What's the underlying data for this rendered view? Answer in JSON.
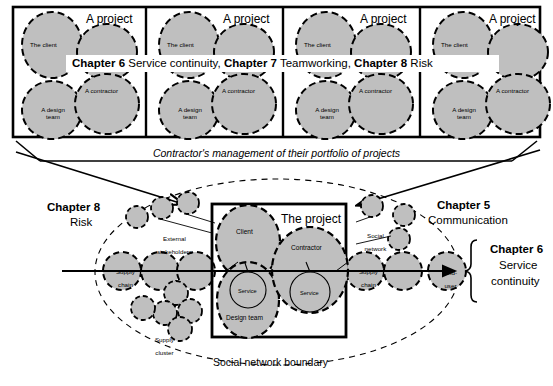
{
  "diagram": {
    "title_banner": {
      "segments": [
        {
          "bold": "Chapter 6",
          "text": " Service continuity,"
        },
        {
          "bold": "Chapter 7",
          "text": " Teamworking,"
        },
        {
          "bold": "Chapter 8",
          "text": " Risk"
        }
      ],
      "full_text": "Chapter 6 Service continuity, Chapter 7 Teamworking, Chapter 8 Risk"
    },
    "portfolio_caption": "Contractor's management of their portfolio of projects",
    "portfolio": {
      "panel_count": 4,
      "panels": [
        {
          "title": "A project",
          "nodes": [
            "The client",
            "A contractor",
            "A design team"
          ]
        },
        {
          "title": "A project",
          "nodes": [
            "The client",
            "A contractor",
            "A design team"
          ]
        },
        {
          "title": "A project",
          "nodes": [
            "The client",
            "A contractor",
            "A design team"
          ]
        },
        {
          "title": "A project",
          "nodes": [
            "The client",
            "A contractor",
            "A design team"
          ]
        }
      ]
    },
    "network": {
      "project_box_label": "The project",
      "boundary_label": "Social network boundary",
      "core_nodes": [
        {
          "label": "Client"
        },
        {
          "label": "Contractor"
        },
        {
          "label": "Design team"
        },
        {
          "label": "Service"
        },
        {
          "label": "Service"
        }
      ],
      "annotations": [
        {
          "label": "External\nstakeholders"
        },
        {
          "label": "Social\nnetwork"
        },
        {
          "label": "Supply\ncluster"
        }
      ],
      "chain_nodes": [
        {
          "label": "Supply\nchain"
        },
        {
          "label": "Supply\nchain"
        },
        {
          "label": "End-\nuser"
        }
      ],
      "left_annotation_line1": "External",
      "left_annotation_line2": "stakeholders",
      "right_annotation_line1": "Social",
      "right_annotation_line2": "network",
      "supply_cluster_line1": "Supply",
      "supply_cluster_line2": "cluster",
      "supply_chain_left_line1": "Supply",
      "supply_chain_left_line2": "chain",
      "supply_chain_right_line1": "Supply",
      "supply_chain_right_line2": "chain",
      "end_user_line1": "End-",
      "end_user_line2": "user"
    },
    "chapter_labels": {
      "left": {
        "head": "Chapter 8",
        "sub": "Risk"
      },
      "right_top": {
        "head": "Chapter 5",
        "sub": "Communication"
      },
      "right_bottom": {
        "head": "Chapter 6",
        "sub1": "Service",
        "sub2": "continuity"
      }
    },
    "colors": {
      "node_fill": "#bfbfbf",
      "stroke": "#000000",
      "background": "#ffffff"
    }
  }
}
